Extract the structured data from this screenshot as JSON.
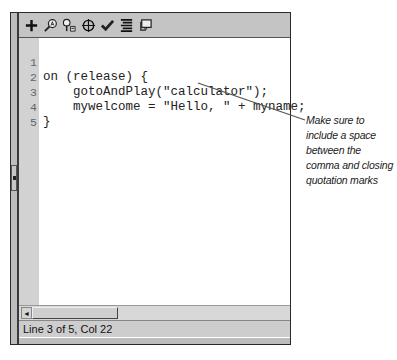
{
  "header_cutoff_text": "…cut-off caption text above the panel…",
  "toolbar": {
    "icons": [
      {
        "name": "add-statement-icon",
        "glyph": "+"
      },
      {
        "name": "find-icon",
        "glyph": "find"
      },
      {
        "name": "replace-icon",
        "glyph": "replace"
      },
      {
        "name": "insert-target-path-icon",
        "glyph": "target"
      },
      {
        "name": "check-syntax-icon",
        "glyph": "check"
      },
      {
        "name": "auto-format-icon",
        "glyph": "format"
      },
      {
        "name": "show-code-hint-icon",
        "glyph": "hint"
      }
    ]
  },
  "editor": {
    "lines": [
      {
        "number": "1",
        "code": "on (release) {"
      },
      {
        "number": "2",
        "code": "    gotoAndPlay(\"calculator\");"
      },
      {
        "number": "3",
        "code": "    mywelcome = \"Hello, \" + myname;"
      },
      {
        "number": "4",
        "code": "}"
      },
      {
        "number": "5",
        "code": ""
      }
    ]
  },
  "scrollbar": {
    "left_arrow": "◄"
  },
  "status_bar": {
    "text": "Line 3 of 5, Col 22"
  },
  "callout": {
    "text": "Make sure to include a space between the comma and closing quotation marks"
  },
  "colors": {
    "panel_gray": "#c9c9c9",
    "gutter_gray": "#d2d2d2",
    "border_dark": "#2a2a2a",
    "callout_line": "#555555"
  }
}
